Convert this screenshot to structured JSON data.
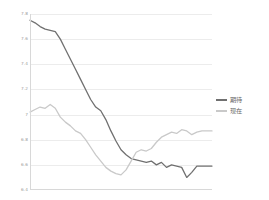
{
  "chart_data": {
    "type": "line",
    "title": "",
    "xlabel": "",
    "ylabel": "",
    "ylim": [
      6.4,
      7.8
    ],
    "yticks": [
      "7.8",
      "7.6",
      "7.4",
      "7.2",
      "7",
      "6.8",
      "6.6",
      "6.4"
    ],
    "ytick_values": [
      7.8,
      7.6,
      7.4,
      7.2,
      7.0,
      6.8,
      6.6,
      6.4
    ],
    "grid": true,
    "legend_position": "right",
    "x": [
      0,
      1,
      2,
      3,
      4,
      5,
      6,
      7,
      8,
      9,
      10,
      11,
      12,
      13,
      14,
      15,
      16,
      17,
      18,
      19,
      20,
      21,
      22,
      23,
      24,
      25,
      26,
      27,
      28,
      29,
      30,
      31,
      32,
      33,
      34,
      35,
      36
    ],
    "series": [
      {
        "name": "期待",
        "color": "#707070",
        "values": [
          7.75,
          7.73,
          7.7,
          7.68,
          7.67,
          7.66,
          7.6,
          7.52,
          7.44,
          7.36,
          7.28,
          7.2,
          7.12,
          7.06,
          7.03,
          6.96,
          6.87,
          6.79,
          6.72,
          6.68,
          6.65,
          6.64,
          6.63,
          6.62,
          6.63,
          6.6,
          6.62,
          6.58,
          6.6,
          6.59,
          6.58,
          6.5,
          6.54,
          6.59,
          6.59,
          6.59,
          6.59
        ]
      },
      {
        "name": "现在",
        "color": "#c9c9c9",
        "values": [
          7.02,
          7.04,
          7.06,
          7.05,
          7.08,
          7.05,
          6.98,
          6.94,
          6.91,
          6.87,
          6.85,
          6.8,
          6.74,
          6.68,
          6.63,
          6.58,
          6.55,
          6.53,
          6.52,
          6.56,
          6.63,
          6.7,
          6.72,
          6.71,
          6.73,
          6.78,
          6.82,
          6.84,
          6.86,
          6.85,
          6.88,
          6.87,
          6.84,
          6.86,
          6.87,
          6.87,
          6.87
        ]
      }
    ]
  }
}
